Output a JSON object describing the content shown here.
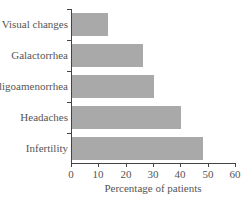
{
  "chart_data": {
    "type": "bar",
    "orientation": "horizontal",
    "title": "",
    "categories": [
      "Visual changes",
      "Galactorrhea",
      "Oligoamenorrhea",
      "Headaches",
      "Infertility"
    ],
    "values": [
      13,
      26,
      30,
      40,
      48
    ],
    "xlabel": "Percentage of patients",
    "ylabel": "",
    "xlim": [
      0,
      60
    ],
    "xticks": [
      "0",
      "10",
      "20",
      "30",
      "40",
      "50",
      "60"
    ],
    "grid": false,
    "legend": null,
    "bar_color": "#a9a9a9"
  }
}
